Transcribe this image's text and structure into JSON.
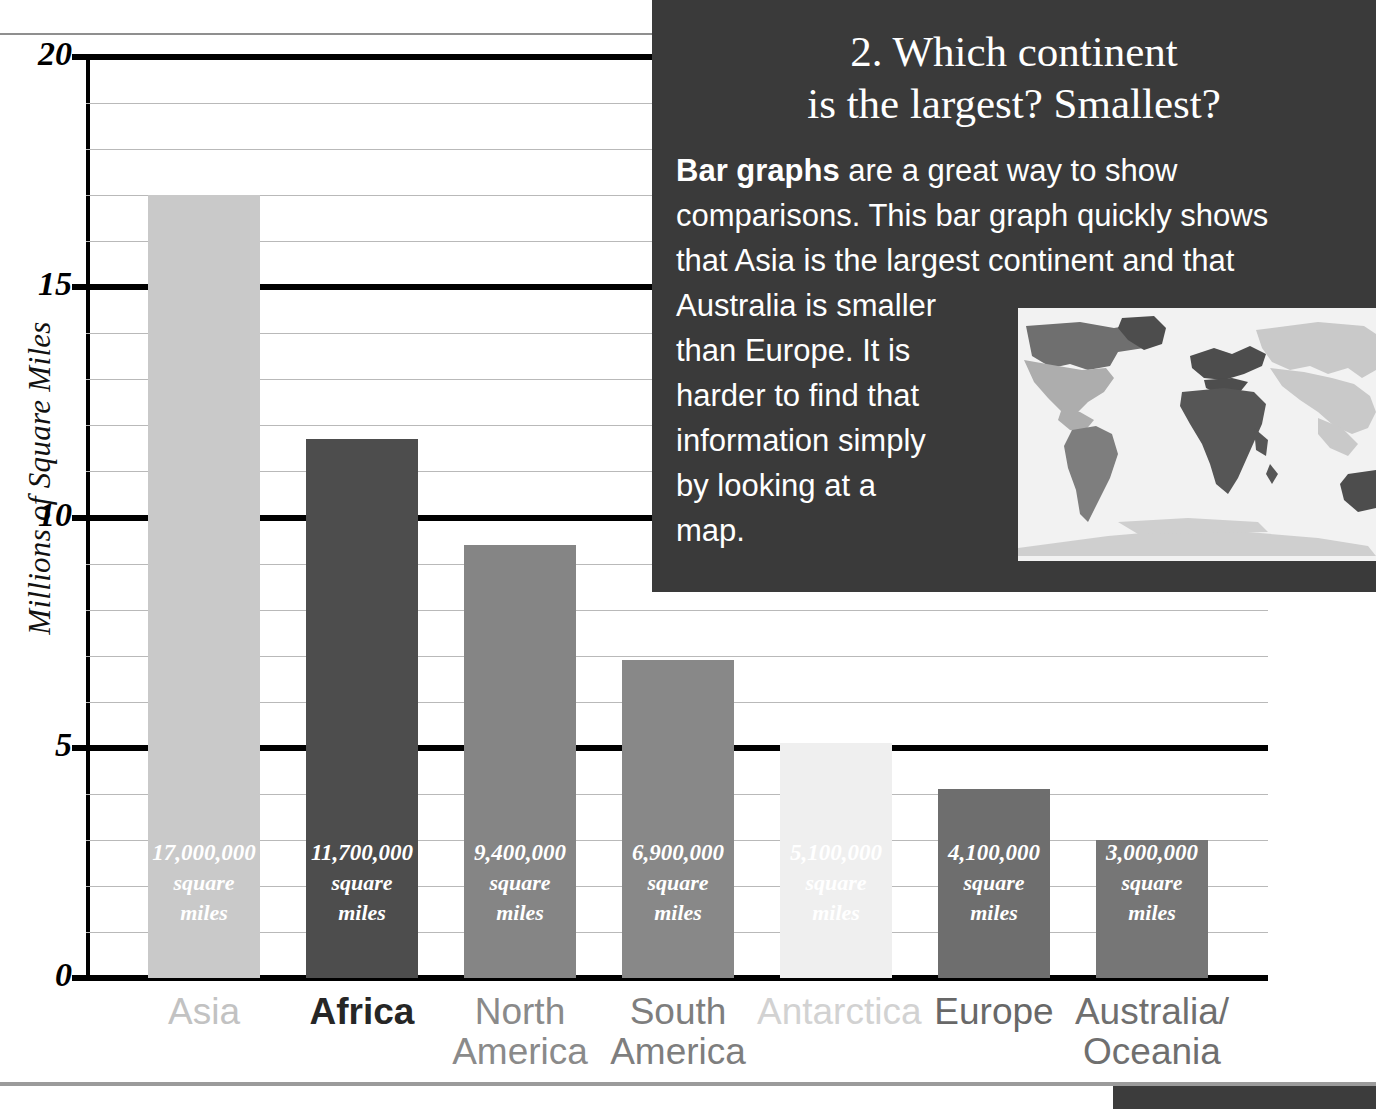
{
  "chart_data": {
    "type": "bar",
    "title": "",
    "xlabel": "",
    "ylabel": "Millions of Square Miles",
    "ylim": [
      0,
      20
    ],
    "ytick_labels": [
      "0",
      "5",
      "10",
      "15",
      "20"
    ],
    "ytick_values": [
      0,
      5,
      10,
      15,
      20
    ],
    "major_gridlines": [
      0,
      5,
      10,
      15,
      20
    ],
    "minor_gridline_step": 1,
    "grid": true,
    "legend": "none",
    "categories": [
      "Asia",
      "Africa",
      "North America",
      "South America",
      "Antarctica",
      "Europe",
      "Australia/ Oceania"
    ],
    "values": [
      17.0,
      11.7,
      9.4,
      6.9,
      5.1,
      4.1,
      3.0
    ],
    "data_labels": [
      "17,000,000",
      "11,700,000",
      "9,400,000",
      "6,900,000",
      "5,100,000",
      "4,100,000",
      "3,000,000"
    ],
    "data_label_unit_line1": "square",
    "data_label_unit_line2": "miles",
    "bar_colors": [
      "#c9c9c9",
      "#4d4d4d",
      "#858585",
      "#888888",
      "#efefef",
      "#6e6e6e",
      "#767676"
    ]
  },
  "axis": {
    "y_title": "Millions of Square Miles",
    "ticks": [
      {
        "label": "20",
        "value": 20
      },
      {
        "label": "15",
        "value": 15
      },
      {
        "label": "10",
        "value": 10
      },
      {
        "label": "5",
        "value": 5
      },
      {
        "label": "0",
        "value": 0
      }
    ]
  },
  "bars": [
    {
      "category": "Asia",
      "label_line1": "Asia",
      "label_line2": "",
      "value": 17.0,
      "value_label": "17,000,000",
      "unit_line1": "square",
      "unit_line2": "miles",
      "color": "#c9c9c9",
      "label_color": "#c2c2c2"
    },
    {
      "category": "Africa",
      "label_line1": "Africa",
      "label_line2": "",
      "value": 11.7,
      "value_label": "11,700,000",
      "unit_line1": "square",
      "unit_line2": "miles",
      "color": "#4d4d4d",
      "label_color": "#262626"
    },
    {
      "category": "North America",
      "label_line1": "North",
      "label_line2": "America",
      "value": 9.4,
      "value_label": "9,400,000",
      "unit_line1": "square",
      "unit_line2": "miles",
      "color": "#858585",
      "label_color": "#8a8a8a"
    },
    {
      "category": "South America",
      "label_line1": "South",
      "label_line2": "America",
      "value": 6.9,
      "value_label": "6,900,000",
      "unit_line1": "square",
      "unit_line2": "miles",
      "color": "#888888",
      "label_color": "#7e7e7e"
    },
    {
      "category": "Antarctica",
      "label_line1": "Antarctica",
      "label_line2": "",
      "value": 5.1,
      "value_label": "5,100,000",
      "unit_line1": "square",
      "unit_line2": "miles",
      "color": "#efefef",
      "label_color": "#d2d2d2"
    },
    {
      "category": "Europe",
      "label_line1": "Europe",
      "label_line2": "",
      "value": 4.1,
      "value_label": "4,100,000",
      "unit_line1": "square",
      "unit_line2": "miles",
      "color": "#6e6e6e",
      "label_color": "#686868"
    },
    {
      "category": "Australia/Oceania",
      "label_line1": "Australia/",
      "label_line2": "Oceania",
      "value": 3.0,
      "value_label": "3,000,000",
      "unit_line1": "square",
      "unit_line2": "miles",
      "color": "#767676",
      "label_color": "#6f6f6f"
    }
  ],
  "panel": {
    "title_line1": "2. Which continent",
    "title_line2": "is the largest? Smallest?",
    "body_lead": "Bar graphs",
    "body_line1_rest": " are a great way to show",
    "body_line2": "comparisons. This bar graph quickly shows",
    "body_line3": "that Asia is the largest continent and that",
    "body_line4": "Australia is smaller",
    "body_line5": "than Europe. It is",
    "body_line6": "harder to find that",
    "body_line7": "information simply",
    "body_line8": "by looking at a",
    "body_line9": "map.",
    "background_color": "#3a3a3a",
    "text_color": "#ffffff"
  },
  "map": {
    "alt": "world-map-continents-shaded",
    "ocean_color": "#f2f2f2"
  }
}
